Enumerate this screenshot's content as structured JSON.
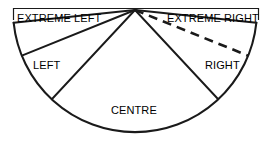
{
  "figure": {
    "type": "sector-fan-diagram",
    "title": "",
    "stroke_color": "#1a1a1a",
    "background_color": "#ffffff",
    "frame_color": "#1a1a1a"
  },
  "labels": {
    "extreme_left": "EXTREME LEFT",
    "left": "LEFT",
    "centre": "CENTRE",
    "right": "RIGHT",
    "extreme_right": "EXTREME RIGHT"
  },
  "geometry": {
    "apex_x": 135,
    "apex_y": 10,
    "radius": 122,
    "arc_start_deg": 174,
    "arc_end_deg": 6,
    "dividers": [
      {
        "name": "extreme-left-left-divider",
        "angle_deg": 158,
        "style": "solid"
      },
      {
        "name": "left-centre-divider",
        "angle_deg": 133,
        "style": "solid"
      },
      {
        "name": "centre-right-divider",
        "angle_deg": 47,
        "style": "solid"
      },
      {
        "name": "right-extreme-right-divider",
        "angle_deg": 22,
        "style": "dashed"
      }
    ],
    "outer_frame": {
      "top_y": 8,
      "left_x": 13,
      "right_x": 259,
      "stub_height": 12
    }
  },
  "sectors": [
    {
      "name": "extreme-left",
      "label": "EXTREME LEFT",
      "from_deg": 174,
      "to_deg": 158
    },
    {
      "name": "left",
      "label": "LEFT",
      "from_deg": 158,
      "to_deg": 133
    },
    {
      "name": "centre",
      "label": "CENTRE",
      "from_deg": 133,
      "to_deg": 47
    },
    {
      "name": "right",
      "label": "RIGHT",
      "from_deg": 47,
      "to_deg": 22
    },
    {
      "name": "extreme-right",
      "label": "EXTREME RIGHT",
      "from_deg": 22,
      "to_deg": 6
    }
  ]
}
